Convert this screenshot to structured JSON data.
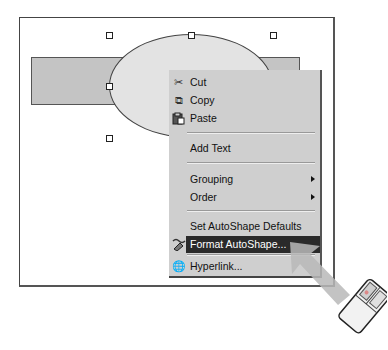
{
  "canvas": {
    "handles": [
      {
        "x": 108,
        "y": 33
      },
      {
        "x": 189,
        "y": 33
      },
      {
        "x": 271,
        "y": 33
      },
      {
        "x": 108,
        "y": 85
      },
      {
        "x": 108,
        "y": 136
      }
    ]
  },
  "context_menu": {
    "items": [
      {
        "label": "Cut",
        "icon": "scissors-icon",
        "glyph": "✂",
        "top": 4
      },
      {
        "label": "Copy",
        "icon": "copy-icon",
        "glyph": "⧉",
        "top": 22
      },
      {
        "label": "Paste",
        "icon": "paste-icon",
        "glyph": "📋",
        "top": 40
      },
      {
        "label": "Add Text",
        "top": 70
      },
      {
        "label": "Grouping",
        "submenu": true,
        "top": 101
      },
      {
        "label": "Order",
        "submenu": true,
        "top": 119
      },
      {
        "label": "Set AutoShape Defaults",
        "top": 148
      },
      {
        "label": "Format AutoShape...",
        "icon": "format-autoshape-icon",
        "highlighted": true,
        "top": 166
      },
      {
        "label": "Hyperlink...",
        "icon": "hyperlink-globe-icon",
        "glyph": "🌐",
        "top": 188
      }
    ]
  },
  "colors": {
    "menu_bg": "#cfcfcf",
    "highlight_bg": "#2a2a2a",
    "rect_fill": "#c4c4c4",
    "ellipse_fill": "#e3e3e3"
  }
}
